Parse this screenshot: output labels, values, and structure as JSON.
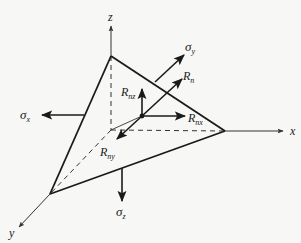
{
  "figure": {
    "colors": {
      "background": "#f7f7f5",
      "ink": "#1a1a1a",
      "axis_ink": "#333333"
    }
  },
  "axes": {
    "x": {
      "label": "x"
    },
    "y": {
      "label": "y"
    },
    "z": {
      "label": "z"
    }
  },
  "stresses": {
    "sigma_x": {
      "symbol": "σ",
      "sub": "x"
    },
    "sigma_y": {
      "symbol": "σ",
      "sub": "y"
    },
    "sigma_z": {
      "symbol": "σ",
      "sub": "z"
    }
  },
  "resultants": {
    "R_n": {
      "symbol": "R",
      "sub": "n"
    },
    "R_nx": {
      "symbol": "R",
      "sub": "nx"
    },
    "R_ny": {
      "symbol": "R",
      "sub": "ny"
    },
    "R_nz": {
      "symbol": "R",
      "sub": "nz"
    }
  }
}
